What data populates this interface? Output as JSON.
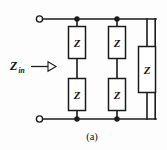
{
  "figure": {
    "caption": "(a)",
    "input_label": {
      "symbol": "Z",
      "subscript": "in"
    },
    "colors": {
      "background": "#fdfdfd",
      "wire": "#1b1b1b",
      "component_fill": "#ffffff",
      "text": "#111111"
    },
    "components": [
      {
        "id": "z-left-top",
        "label": "Z"
      },
      {
        "id": "z-left-bottom",
        "label": "Z"
      },
      {
        "id": "z-mid-top",
        "label": "Z"
      },
      {
        "id": "z-mid-bottom",
        "label": "Z"
      },
      {
        "id": "z-right",
        "label": "Z"
      }
    ],
    "terminals": [
      {
        "id": "terminal-top",
        "type": "open-circle"
      },
      {
        "id": "terminal-bottom",
        "type": "open-circle"
      }
    ],
    "junctions": [
      {
        "id": "junction-top-left"
      },
      {
        "id": "junction-top-mid"
      },
      {
        "id": "junction-bottom-left"
      },
      {
        "id": "junction-bottom-mid"
      }
    ]
  }
}
